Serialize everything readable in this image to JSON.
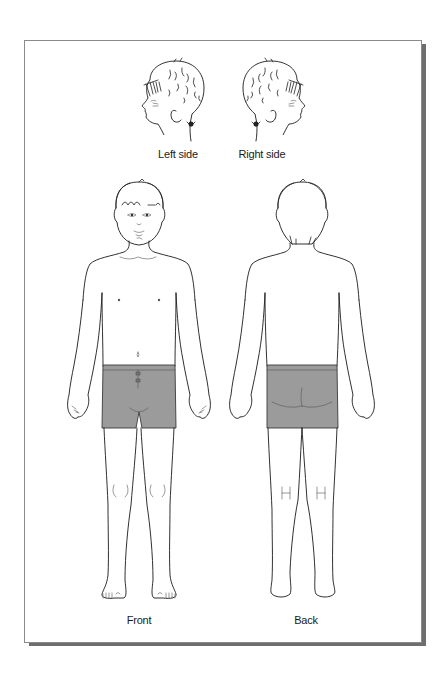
{
  "figure": {
    "type": "body-diagram",
    "views": [
      {
        "id": "left-side",
        "label": "Left side",
        "kind": "head-profile"
      },
      {
        "id": "right-side",
        "label": "Right side",
        "kind": "head-profile"
      },
      {
        "id": "front",
        "label": "Front",
        "kind": "full-body"
      },
      {
        "id": "back",
        "label": "Back",
        "kind": "full-body"
      }
    ]
  },
  "colors": {
    "background": "#ffffff",
    "frame_border": "#8a8a8a",
    "frame_shadow": "#6e6e6e",
    "line": "#1a1a1a",
    "shorts": "#9b9b9b"
  }
}
